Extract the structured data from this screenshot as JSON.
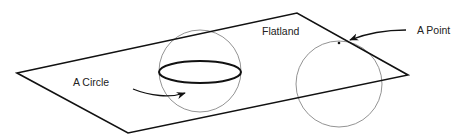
{
  "diagram": {
    "title": "Flatland",
    "labels": {
      "plane": "Flatland",
      "point": "A Point",
      "circle": "A Circle"
    },
    "colors": {
      "background": "#ffffff",
      "plane_stroke": "#111111",
      "sphere_stroke": "#777777",
      "text": "#222222"
    },
    "elements": [
      {
        "id": "plane",
        "shape": "parallelogram",
        "label": "Flatland"
      },
      {
        "id": "sphere-intersecting",
        "shape": "circle",
        "note": "sphere passing through plane, cross-section ellipse"
      },
      {
        "id": "sphere-touching",
        "shape": "circle",
        "note": "sphere touching plane at a single point"
      },
      {
        "id": "arrow-circle",
        "from": "A Circle",
        "to": "cross-section ellipse"
      },
      {
        "id": "arrow-point",
        "from": "A Point",
        "to": "tangent point"
      }
    ]
  }
}
